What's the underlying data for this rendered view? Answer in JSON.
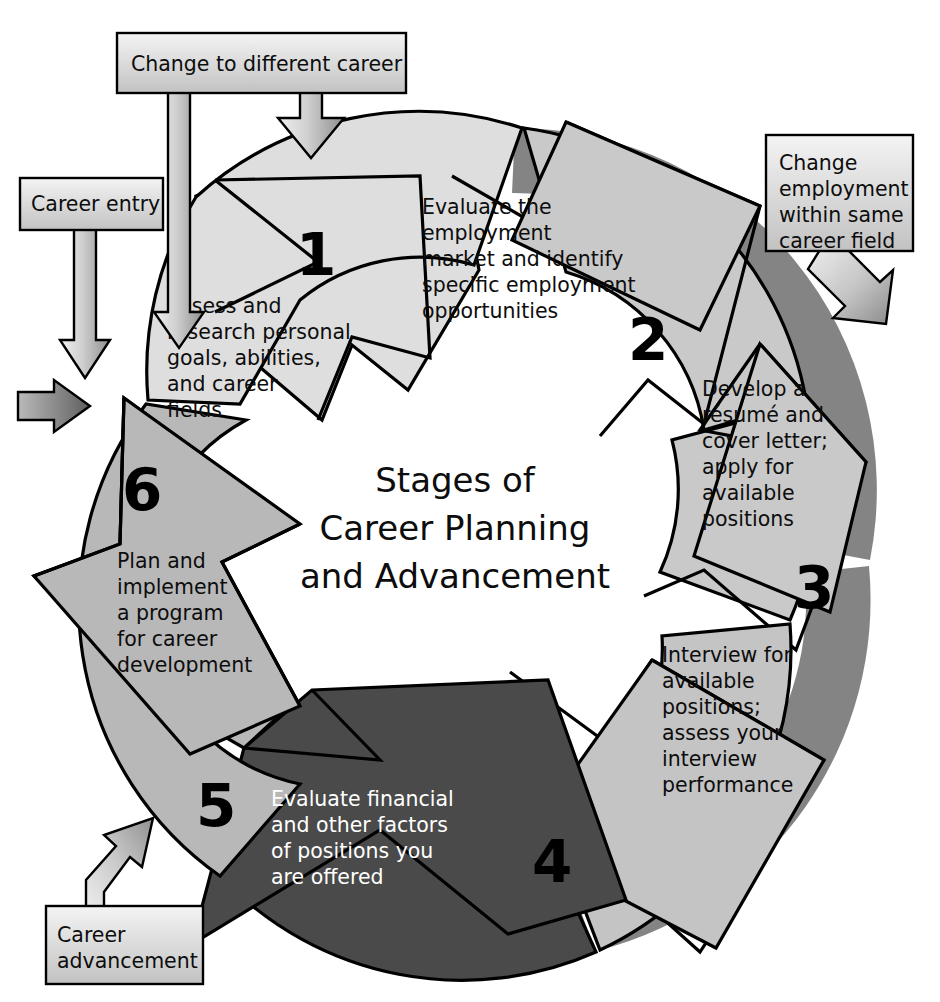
{
  "diagram": {
    "title_lines": [
      "Stages of",
      "Career Planning",
      "and Advancement"
    ],
    "type": "cycle",
    "colors": {
      "light_segment": "#dedede",
      "mid_segment": "#b8b8b8",
      "dark_segment": "#4a4a4a",
      "shadow": "#5a5a5a",
      "outline": "#000000",
      "callout_fill_top": "#f2f2f2",
      "callout_fill_bottom": "#c8c8c8",
      "callout_text": "#0d0d0d",
      "light_text": "#ffffff"
    },
    "stages": [
      {
        "number": "1",
        "lines": [
          "Assess and",
          "research personal",
          "goals, abilities,",
          "and career",
          "fields"
        ],
        "fill": "#dedede",
        "text_color": "#0d0d0d"
      },
      {
        "number": "2",
        "lines": [
          "Evaluate the",
          "employment",
          "market and identify",
          "specific employment",
          "opportunities"
        ],
        "fill": "#c9c9c9",
        "text_color": "#0d0d0d"
      },
      {
        "number": "3",
        "lines": [
          "Develop a",
          "résumé and",
          "cover letter;",
          "apply for",
          "available",
          "positions"
        ],
        "fill": "#c9c9c9",
        "text_color": "#0d0d0d"
      },
      {
        "number": "4",
        "lines": [
          "Interview for",
          "available",
          "positions;",
          "assess your",
          "interview",
          "performance"
        ],
        "fill": "#c4c4c4",
        "text_color": "#0d0d0d"
      },
      {
        "number": "5",
        "lines": [
          "Evaluate financial",
          "and other factors",
          "of positions you",
          "are offered"
        ],
        "fill": "#4a4a4a",
        "text_color": "#ffffff"
      },
      {
        "number": "6",
        "lines": [
          "Plan and",
          "implement",
          "a program",
          "for career",
          "development"
        ],
        "fill": "#b8b8b8",
        "text_color": "#0d0d0d"
      }
    ],
    "callouts": [
      {
        "id": "change-to-different-career",
        "lines": [
          "Change to different career"
        ],
        "position": "top"
      },
      {
        "id": "career-entry",
        "lines": [
          "Career entry"
        ],
        "position": "top-left"
      },
      {
        "id": "change-employment-within-same-career-field",
        "lines": [
          "Change",
          "employment",
          "within same",
          "career field"
        ],
        "position": "right"
      },
      {
        "id": "career-advancement",
        "lines": [
          "Career",
          "advancement"
        ],
        "position": "bottom-left"
      }
    ]
  }
}
